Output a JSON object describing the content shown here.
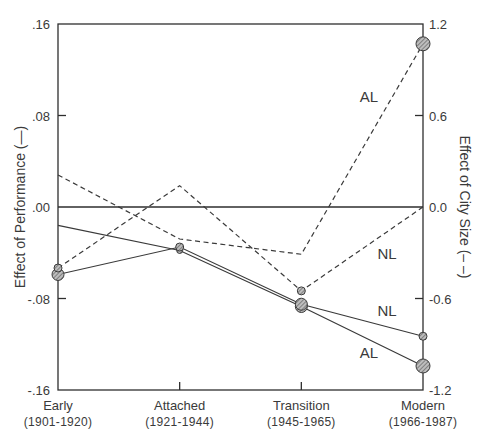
{
  "chart_data": {
    "type": "line",
    "title": "",
    "xlabel": "",
    "categories": [
      "Early",
      "Attached",
      "Transition",
      "Modern"
    ],
    "category_periods": [
      "(1901-1920)",
      "(1921-1944)",
      "(1945-1965)",
      "(1966-1987)"
    ],
    "left_axis": {
      "label": "Effect of Performance (—)",
      "ylim": [
        -0.16,
        0.16
      ],
      "ticks": [
        0.16,
        0.08,
        0.0,
        -0.08,
        -0.16
      ],
      "tick_labels": [
        ".16",
        ".08",
        ".00",
        "-.08",
        "-.16"
      ]
    },
    "right_axis": {
      "label": "Effect of City Size (– –)",
      "ylim": [
        -1.2,
        1.2
      ],
      "ticks": [
        1.2,
        0.6,
        0.0,
        -0.6,
        -1.2
      ],
      "tick_labels": [
        "1.2",
        "0.6",
        "0.0",
        "-0.6",
        "-1.2"
      ]
    },
    "grid": false,
    "zero_line": true,
    "series": [
      {
        "name": "AL",
        "measure": "Effect of Performance",
        "axis": "left",
        "style": "solid",
        "values": [
          -0.016,
          -0.038,
          -0.087,
          -0.139
        ],
        "marker_sizes": [
          0,
          3,
          6,
          7
        ],
        "label_pos": [
          369,
          358
        ]
      },
      {
        "name": "NL",
        "measure": "Effect of Performance",
        "axis": "left",
        "style": "solid",
        "values": [
          -0.059,
          -0.035,
          -0.085,
          -0.113
        ],
        "marker_sizes": [
          6,
          4,
          6,
          4
        ],
        "label_pos": [
          387,
          316
        ]
      },
      {
        "name": "AL",
        "measure": "Effect of City Size",
        "axis": "right",
        "style": "dashed",
        "values": [
          0.21,
          -0.21,
          -0.31,
          1.07
        ],
        "marker_sizes": [
          0,
          0,
          0,
          7
        ],
        "label_pos": [
          369,
          102
        ]
      },
      {
        "name": "NL",
        "measure": "Effect of City Size",
        "axis": "right",
        "style": "dashed",
        "values": [
          -0.4,
          0.14,
          -0.55,
          0.0
        ],
        "marker_sizes": [
          4,
          0,
          4,
          0
        ],
        "label_pos": [
          387,
          259
        ]
      }
    ]
  }
}
